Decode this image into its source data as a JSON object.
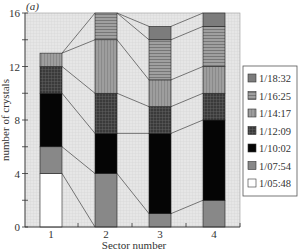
{
  "panel_label": "(a)",
  "chart_data": {
    "type": "bar",
    "stacked": true,
    "title": "",
    "xlabel": "Sector number",
    "ylabel": "number of crystals",
    "categories": [
      "1",
      "2",
      "3",
      "4"
    ],
    "ylim": [
      0,
      16
    ],
    "yticks": [
      0,
      4,
      8,
      12,
      16
    ],
    "grid": true,
    "legend_position": "right",
    "series": [
      {
        "name": "1/05:48",
        "values": [
          4,
          0,
          0,
          0
        ],
        "pattern": "white"
      },
      {
        "name": "1/07:54",
        "values": [
          2,
          4,
          1,
          2
        ],
        "pattern": "gray"
      },
      {
        "name": "1/10:02",
        "values": [
          4,
          3,
          6,
          6
        ],
        "pattern": "black"
      },
      {
        "name": "1/12:09",
        "values": [
          2,
          3,
          2,
          2
        ],
        "pattern": "dark-grid"
      },
      {
        "name": "1/14:17",
        "values": [
          1,
          4,
          2,
          2
        ],
        "pattern": "vertical-stripes"
      },
      {
        "name": "1/16:25",
        "values": [
          0,
          2,
          3,
          3
        ],
        "pattern": "horizontal-stripes"
      },
      {
        "name": "1/18:32",
        "values": [
          0,
          0,
          1,
          1
        ],
        "pattern": "medium-gray"
      }
    ],
    "totals": [
      13,
      16,
      15,
      16
    ]
  },
  "legend": {
    "items": [
      "1/18:32",
      "1/16:25",
      "1/14:17",
      "1/12:09",
      "1/10:02",
      "1/07:54",
      "1/05:48"
    ]
  },
  "axes": {
    "y_tick_labels": [
      "0",
      "4",
      "8",
      "12",
      "16"
    ],
    "x_tick_labels": [
      "1",
      "2",
      "3",
      "4"
    ]
  }
}
